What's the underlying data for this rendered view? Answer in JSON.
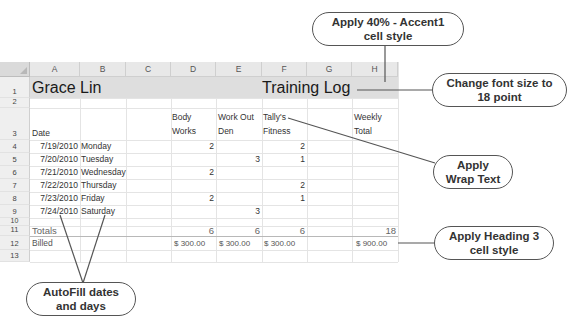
{
  "columns": [
    "A",
    "B",
    "C",
    "D",
    "E",
    "F",
    "G",
    "H"
  ],
  "rows": [
    "1",
    "2",
    "3",
    "4",
    "5",
    "6",
    "7",
    "8",
    "9",
    "10",
    "11",
    "12",
    "13"
  ],
  "cells": {
    "A1": "Grace Lin",
    "F1": "Training Log",
    "A3": "Date",
    "D3a": "Body",
    "D3b": "Works",
    "E3a": "Work Out",
    "E3b": "Den",
    "F3a": "Tally's",
    "F3b": "Fitness",
    "H3a": "Weekly",
    "H3b": "Total",
    "A4": "7/19/2010",
    "B4": "Monday",
    "D4": "2",
    "F4": "2",
    "A5": "7/20/2010",
    "B5": "Tuesday",
    "E5": "3",
    "F5": "1",
    "A6": "7/21/2010",
    "B6": "Wednesday",
    "D6": "2",
    "A7": "7/22/2010",
    "B7": "Thursday",
    "F7": "2",
    "A8": "7/23/2010",
    "B8": "Friday",
    "D8": "2",
    "F8": "1",
    "A9": "7/24/2010",
    "B9": "Saturday",
    "E9": "3",
    "A11": "Totals",
    "D11": "6",
    "E11": "6",
    "F11": "6",
    "H11": "18",
    "A12": "Billed",
    "D12": "$  300.00",
    "E12": "$  300.00",
    "F12": "$  300.00",
    "H12": "$  900.00"
  },
  "callouts": {
    "accent": "Apply 40% - Accent1 cell style",
    "accent_l1": "Apply 40% - Accent1",
    "accent_l2": "cell style",
    "font_l1": "Change font size to",
    "font_l2": "18 point",
    "wrap_l1": "Apply",
    "wrap_l2": "Wrap Text",
    "heading_l1": "Apply Heading 3",
    "heading_l2": "cell style",
    "autofill_l1": "AutoFill dates",
    "autofill_l2": "and days"
  },
  "colors": {
    "row1_fill": "#dedede",
    "grid": "#e4e4e4",
    "header_bg": "#e8e8e8"
  }
}
